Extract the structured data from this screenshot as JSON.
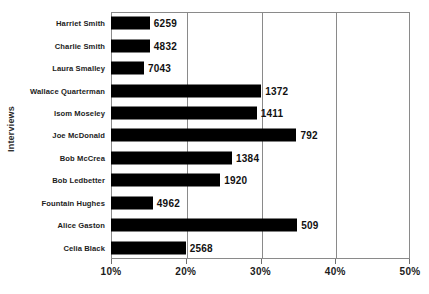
{
  "chart_data": {
    "type": "bar",
    "orientation": "horizontal",
    "title": "",
    "xlabel": "",
    "ylabel": "Interviews",
    "xlim": [
      10,
      50
    ],
    "xtick_labels": [
      "10%",
      "20%",
      "30%",
      "40%",
      "50%"
    ],
    "xticks": [
      10,
      20,
      30,
      40,
      50
    ],
    "grid": true,
    "legend": false,
    "bar_color": "#000000",
    "axis_color": "#808080",
    "categories": [
      "Harriet Smith",
      "Charlie Smith",
      "Laura Smalley",
      "Wallace Quarterman",
      "Isom Moseley",
      "Joe McDonald",
      "Bob McCrea",
      "Bob Ledbetter",
      "Fountain Hughes",
      "Alice Gaston",
      "Celia Black"
    ],
    "values": [
      15.2,
      15.2,
      14.4,
      30.1,
      29.5,
      34.8,
      26.2,
      24.6,
      15.6,
      34.9,
      20.0
    ],
    "data_labels": [
      "6259",
      "4832",
      "7043",
      "1372",
      "1411",
      "792",
      "1384",
      "1920",
      "4962",
      "509",
      "2568"
    ],
    "points": [
      {
        "category": "Harriet Smith",
        "value": 15.2,
        "label": "6259"
      },
      {
        "category": "Charlie Smith",
        "value": 15.2,
        "label": "4832"
      },
      {
        "category": "Laura Smalley",
        "value": 14.4,
        "label": "7043"
      },
      {
        "category": "Wallace Quarterman",
        "value": 30.1,
        "label": "1372"
      },
      {
        "category": "Isom Moseley",
        "value": 29.5,
        "label": "1411"
      },
      {
        "category": "Joe McDonald",
        "value": 34.8,
        "label": "792"
      },
      {
        "category": "Bob McCrea",
        "value": 26.2,
        "label": "1384"
      },
      {
        "category": "Bob Ledbetter",
        "value": 24.6,
        "label": "1920"
      },
      {
        "category": "Fountain Hughes",
        "value": 15.6,
        "label": "4962"
      },
      {
        "category": "Alice Gaston",
        "value": 34.9,
        "label": "509"
      },
      {
        "category": "Celia Black",
        "value": 20.0,
        "label": "2568"
      }
    ]
  }
}
